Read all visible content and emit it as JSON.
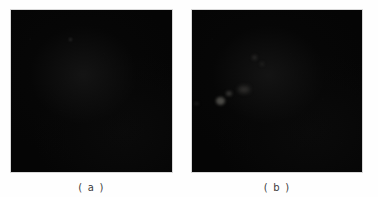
{
  "figure": {
    "background_color": "#fefefe",
    "panel_color": "#050505",
    "caption_color": "#3c3c3c",
    "panels": [
      {
        "id": "a",
        "caption": "( a )",
        "description": "dark-field micrograph panel, essentially uniform black field"
      },
      {
        "id": "b",
        "caption": "( b )",
        "description": "dark-field micrograph panel with a few faint bright specks near centre-left"
      }
    ]
  }
}
